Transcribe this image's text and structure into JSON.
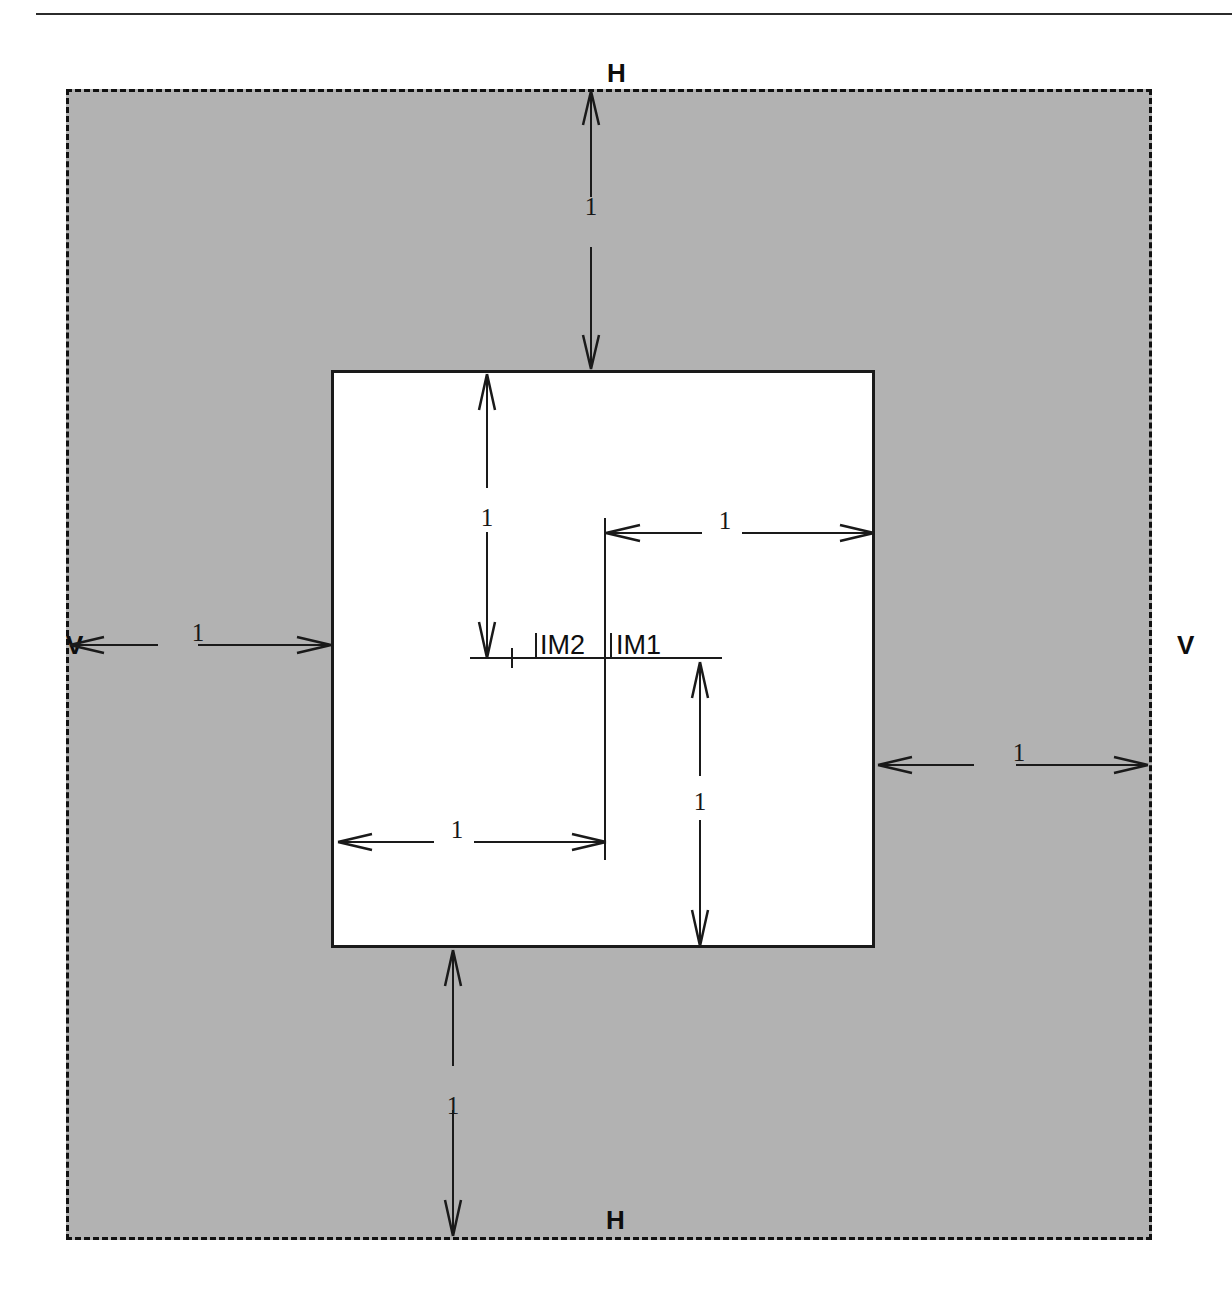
{
  "diagram": {
    "type": "engineering-dimension-drawing",
    "colors": {
      "outer_fill": "#b2b2b2",
      "inner_fill": "#ffffff",
      "line": "#1a1a1a",
      "text": "#0f0f0f"
    },
    "header_rule": {
      "present": true
    },
    "outer_region": {
      "name": "outer-dashed-region",
      "border_style": "dashed",
      "fill": "#b2b2b2"
    },
    "inner_region": {
      "name": "inner-solid-region",
      "border_style": "solid",
      "fill": "#ffffff"
    },
    "polarization_labels": [
      {
        "id": "h-top",
        "text": "H"
      },
      {
        "id": "h-bottom",
        "text": "H"
      },
      {
        "id": "v-left",
        "text": "V"
      },
      {
        "id": "v-right",
        "text": "V"
      }
    ],
    "marker_labels": [
      {
        "id": "im2",
        "text": "IM2"
      },
      {
        "id": "im1",
        "text": "IM1"
      }
    ],
    "dimensions": [
      {
        "id": "dim-top",
        "value": "1",
        "orientation": "vertical",
        "from": "outer-top-edge",
        "to": "inner-top-edge"
      },
      {
        "id": "dim-left",
        "value": "1",
        "orientation": "horizontal",
        "from": "outer-left-edge",
        "to": "inner-left-edge"
      },
      {
        "id": "dim-inner-top",
        "value": "1",
        "orientation": "vertical",
        "from": "inner-top-edge",
        "to": "center-horizontal-line"
      },
      {
        "id": "dim-inner-right",
        "value": "1",
        "orientation": "horizontal",
        "from": "center-vertical-line",
        "to": "inner-right-edge"
      },
      {
        "id": "dim-inner-left",
        "value": "1",
        "orientation": "horizontal",
        "from": "inner-left-edge",
        "to": "center-vertical-line"
      },
      {
        "id": "dim-inner-bottom",
        "value": "1",
        "orientation": "vertical",
        "from": "center-horizontal-line",
        "to": "inner-bottom-edge"
      },
      {
        "id": "dim-right",
        "value": "1",
        "orientation": "horizontal",
        "from": "inner-right-edge",
        "to": "outer-right-edge"
      },
      {
        "id": "dim-bottom",
        "value": "1",
        "orientation": "vertical",
        "from": "inner-bottom-edge",
        "to": "outer-bottom-edge"
      }
    ]
  }
}
